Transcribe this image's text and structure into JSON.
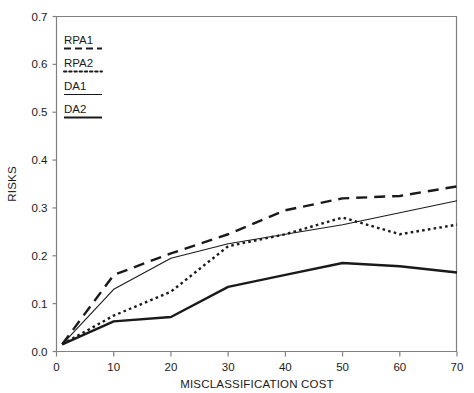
{
  "chart_data": {
    "type": "line",
    "title": "",
    "xlabel": "MISCLASSIFICATION COST",
    "ylabel": "RISKS",
    "xlim": [
      0,
      70
    ],
    "ylim": [
      0.0,
      0.7
    ],
    "xticks": [
      0,
      10,
      20,
      30,
      40,
      50,
      60,
      70
    ],
    "xticklabels": [
      "0",
      "10",
      "20",
      "30",
      "40",
      "50",
      "60",
      "70"
    ],
    "yticks": [
      0.0,
      0.1,
      0.2,
      0.3,
      0.4,
      0.5,
      0.6,
      0.7
    ],
    "yticklabels": [
      "0.0",
      "0.1",
      "0.2",
      "0.3",
      "0.4",
      "0.5",
      "0.6",
      "0.7"
    ],
    "grid": false,
    "legend_position": "upper left inside",
    "series": [
      {
        "name": "RPA1",
        "style": "dashed",
        "x": [
          1,
          10,
          20,
          30,
          40,
          50,
          60,
          70
        ],
        "values": [
          0.015,
          0.16,
          0.205,
          0.245,
          0.295,
          0.32,
          0.325,
          0.345
        ]
      },
      {
        "name": "RPA2",
        "style": "dotted",
        "x": [
          1,
          10,
          20,
          30,
          40,
          50,
          60,
          70
        ],
        "values": [
          0.015,
          0.075,
          0.125,
          0.22,
          0.245,
          0.28,
          0.245,
          0.265
        ]
      },
      {
        "name": "DA1",
        "style": "solid-thin",
        "x": [
          1,
          10,
          20,
          30,
          40,
          50,
          60,
          70
        ],
        "values": [
          0.015,
          0.13,
          0.195,
          0.225,
          0.245,
          0.265,
          0.29,
          0.315
        ]
      },
      {
        "name": "DA2",
        "style": "solid-thick",
        "x": [
          1,
          10,
          20,
          30,
          40,
          50,
          60,
          70
        ],
        "values": [
          0.015,
          0.063,
          0.072,
          0.135,
          0.16,
          0.185,
          0.178,
          0.165
        ]
      }
    ]
  },
  "legend": {
    "items": [
      {
        "label": "RPA1",
        "style": "dashed"
      },
      {
        "label": "RPA2",
        "style": "dotted"
      },
      {
        "label": "DA1",
        "style": "solid-thin"
      },
      {
        "label": "DA2",
        "style": "solid-thick"
      }
    ]
  },
  "colors": {
    "ink": "#1a1a1a",
    "axis": "#808080",
    "background": "#ffffff"
  }
}
